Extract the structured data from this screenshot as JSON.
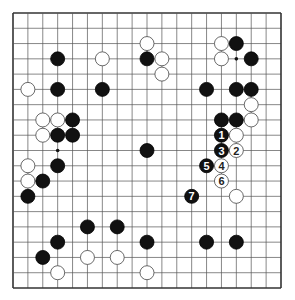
{
  "diagram": {
    "type": "go-board",
    "size": 19,
    "board": {
      "left": 13,
      "top": 13,
      "right": 281,
      "bottom": 288,
      "line_color": "#555555",
      "border_color": "#333333",
      "stone_radius": 7
    },
    "hoshi": [
      [
        3,
        3
      ],
      [
        9,
        3
      ],
      [
        15,
        3
      ],
      [
        3,
        9
      ],
      [
        9,
        9
      ],
      [
        15,
        9
      ],
      [
        3,
        15
      ],
      [
        9,
        15
      ],
      [
        15,
        15
      ]
    ],
    "black_stones": [
      [
        15,
        2
      ],
      [
        3,
        3
      ],
      [
        9,
        3
      ],
      [
        16,
        3
      ],
      [
        3,
        5
      ],
      [
        6,
        5
      ],
      [
        13,
        5
      ],
      [
        15,
        5
      ],
      [
        16,
        5
      ],
      [
        4,
        7
      ],
      [
        14,
        7
      ],
      [
        15,
        7
      ],
      [
        3,
        8
      ],
      [
        4,
        8
      ],
      [
        9,
        9
      ],
      [
        3,
        10
      ],
      [
        2,
        11
      ],
      [
        1,
        12
      ],
      [
        5,
        14
      ],
      [
        7,
        14
      ],
      [
        3,
        15
      ],
      [
        9,
        15
      ],
      [
        13,
        15
      ],
      [
        15,
        15
      ],
      [
        2,
        16
      ]
    ],
    "white_stones": [
      [
        9,
        2
      ],
      [
        14,
        2
      ],
      [
        6,
        3
      ],
      [
        10,
        3
      ],
      [
        14,
        3
      ],
      [
        10,
        4
      ],
      [
        1,
        5
      ],
      [
        16,
        6
      ],
      [
        2,
        7
      ],
      [
        3,
        7
      ],
      [
        16,
        7
      ],
      [
        2,
        8
      ],
      [
        15,
        8
      ],
      [
        1,
        10
      ],
      [
        1,
        11
      ],
      [
        15,
        12
      ],
      [
        5,
        16
      ],
      [
        7,
        16
      ],
      [
        3,
        17
      ],
      [
        9,
        17
      ]
    ],
    "numbered_moves": [
      {
        "n": "1",
        "color": "black",
        "col": 14,
        "row": 8
      },
      {
        "n": "2",
        "color": "white",
        "col": 15,
        "row": 9
      },
      {
        "n": "3",
        "color": "black",
        "col": 14,
        "row": 9
      },
      {
        "n": "4",
        "color": "white",
        "col": 14,
        "row": 10
      },
      {
        "n": "5",
        "color": "black",
        "col": 13,
        "row": 10
      },
      {
        "n": "6",
        "color": "white",
        "col": 14,
        "row": 11
      },
      {
        "n": "7",
        "color": "black",
        "col": 12,
        "row": 12
      }
    ]
  }
}
